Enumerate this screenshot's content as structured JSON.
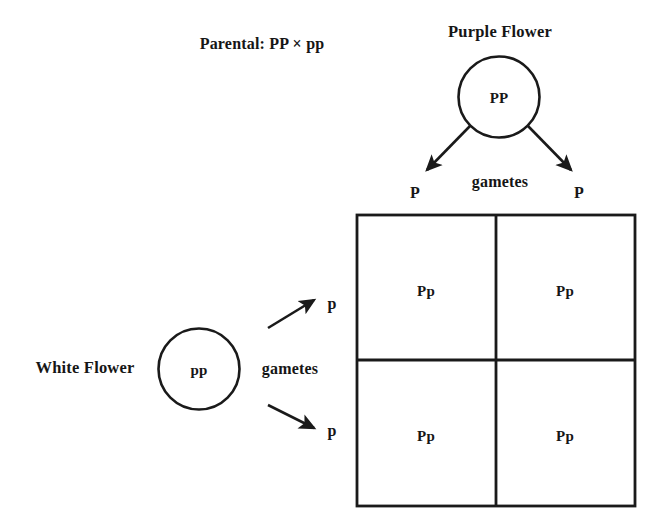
{
  "diagram": {
    "parental_label": "Parental: PP × pp",
    "purple_parent": {
      "title": "Purple Flower",
      "genotype": "PP",
      "gametes_label": "gametes",
      "gamete_left": "P",
      "gamete_right": "P"
    },
    "white_parent": {
      "title": "White Flower",
      "genotype": "pp",
      "gametes_label": "gametes",
      "gamete_top": "p",
      "gamete_bottom": "p"
    },
    "punnett_square": {
      "cells": [
        {
          "row": 0,
          "col": 0,
          "genotype": "Pp"
        },
        {
          "row": 0,
          "col": 1,
          "genotype": "Pp"
        },
        {
          "row": 1,
          "col": 0,
          "genotype": "Pp"
        },
        {
          "row": 1,
          "col": 1,
          "genotype": "Pp"
        }
      ]
    },
    "colors": {
      "stroke": "#1a1a1a",
      "background": "#ffffff",
      "text": "#161616"
    }
  }
}
